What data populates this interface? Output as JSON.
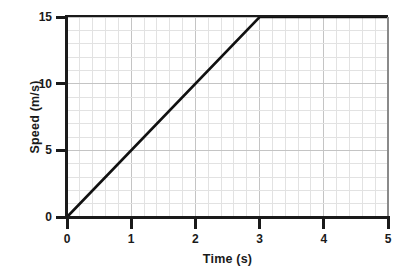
{
  "chart_data": {
    "type": "line",
    "title": "",
    "xlabel": "Time (s)",
    "ylabel": "Speed (m/s)",
    "xlim": [
      0,
      5
    ],
    "ylim": [
      0,
      15
    ],
    "xticks": [
      "0",
      "1",
      "2",
      "3",
      "4",
      "5"
    ],
    "xtick_values": [
      0,
      1,
      2,
      3,
      4,
      5
    ],
    "yticks": [
      "0",
      "5",
      "10",
      "15"
    ],
    "ytick_values": [
      0,
      5,
      10,
      15
    ],
    "grid": true,
    "grid_minor_x_step": 0.2,
    "grid_minor_y_step": 1,
    "grid_major_x_step": 1,
    "grid_major_y_step": 5,
    "legend": false,
    "series": [
      {
        "name": "speed",
        "color": "#111111",
        "x": [
          0,
          1,
          2,
          3,
          4,
          5
        ],
        "values": [
          0,
          5,
          10,
          15,
          15,
          15
        ],
        "points": [
          [
            0,
            0
          ],
          [
            3,
            15
          ],
          [
            5,
            15
          ]
        ],
        "description": "Constant acceleration from 0 to 15 m/s over 3 s, then constant speed of 15 m/s until 5 s"
      }
    ]
  },
  "colors": {
    "axis": "#1a1a1a",
    "line": "#111111",
    "grid_minor": "#e2e2e2",
    "grid_major": "#c4c4c4",
    "background": "#ffffff"
  }
}
